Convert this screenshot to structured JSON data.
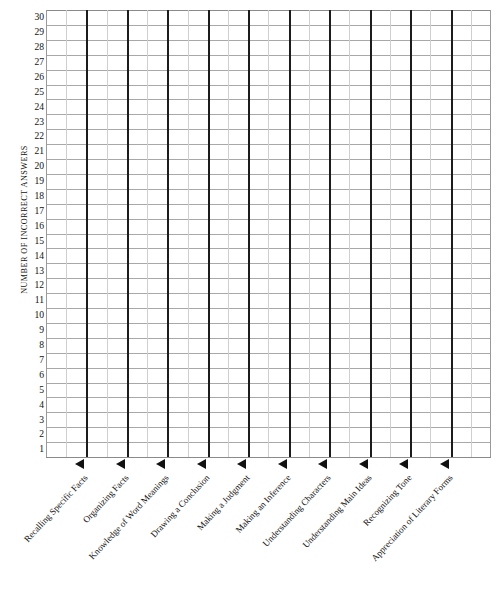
{
  "chart_data": {
    "type": "table",
    "title": "",
    "subtitle": "",
    "xlabel": "",
    "ylabel": "NUMBER OF INCORRECT ANSWERS",
    "ylim": [
      1,
      30
    ],
    "grid": true,
    "legend": false,
    "orientation": "vertical-bars-blank",
    "categories": [
      "Recalling Specific Facts",
      "Organizing Facts",
      "Knowledge of Word Meanings",
      "Drawing a Conclusion",
      "Making a Judgment",
      "Making an Inference",
      "Understanding Characters",
      "Understanding Main Ideas",
      "Recognizing Tone",
      "Appreciation of Literary Forms"
    ],
    "values": [
      0,
      0,
      0,
      0,
      0,
      0,
      0,
      0,
      0,
      0
    ],
    "y_ticks": [
      30,
      29,
      28,
      27,
      26,
      25,
      24,
      23,
      22,
      21,
      20,
      19,
      18,
      17,
      16,
      15,
      14,
      13,
      12,
      11,
      10,
      9,
      8,
      7,
      6,
      5,
      4,
      3,
      2,
      1
    ],
    "colors": {
      "major_gridline": "#1c1c1c",
      "minor_gridline": "#cfcfcf",
      "row_gridline": "#a8a8a8",
      "arrow": "#111111",
      "text": "#111111",
      "background": "#ffffff"
    }
  },
  "axis": {
    "y_title": "NUMBER OF INCORRECT ANSWERS"
  }
}
